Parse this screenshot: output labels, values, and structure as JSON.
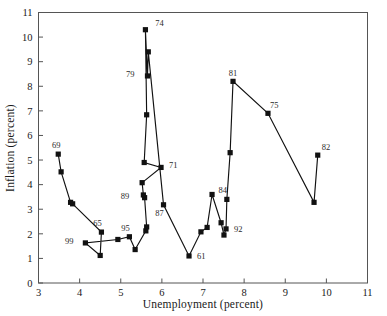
{
  "chart_data": {
    "type": "line",
    "title": "",
    "subtitle": "",
    "xlabel": "Unemployment (percent)",
    "ylabel": "Inflation (percent)",
    "xlim": [
      3,
      11
    ],
    "ylim": [
      0,
      11
    ],
    "xticks": [
      3,
      4,
      5,
      6,
      7,
      8,
      9,
      10,
      11
    ],
    "yticks": [
      0,
      1,
      2,
      3,
      4,
      5,
      6,
      7,
      8,
      9,
      10,
      11
    ],
    "xtick_labels": [
      "3",
      "4",
      "5",
      "6",
      "7",
      "8",
      "9",
      "10",
      "11"
    ],
    "ytick_labels": [
      "0",
      "1",
      "2",
      "3",
      "4",
      "5",
      "6",
      "7",
      "8",
      "9",
      "10",
      "11"
    ],
    "grid": false,
    "legend": false,
    "legend_position": "none",
    "marker": "square",
    "series": [
      {
        "name": "US Phillips curve path",
        "x": [
          3.48,
          3.55,
          3.78,
          3.83,
          4.53,
          4.5,
          4.14,
          4.93,
          5.21,
          5.35,
          5.61,
          5.63,
          5.58,
          5.55,
          5.52,
          5.98,
          5.57,
          5.63,
          5.6,
          5.65,
          5.67,
          6.04,
          6.66,
          6.95,
          7.1,
          7.22,
          7.44,
          7.51,
          7.56,
          7.58,
          7.66,
          7.73,
          8.58,
          9.7,
          9.79
        ],
        "y": [
          5.24,
          4.52,
          3.28,
          3.22,
          2.07,
          1.12,
          1.63,
          1.77,
          1.88,
          1.36,
          2.12,
          2.28,
          3.47,
          3.58,
          4.08,
          4.7,
          4.9,
          6.84,
          10.3,
          8.42,
          9.4,
          3.18,
          1.1,
          2.08,
          2.26,
          3.6,
          2.45,
          1.95,
          2.2,
          3.4,
          5.3,
          8.2,
          6.9,
          3.28,
          5.2
        ]
      }
    ],
    "point_labels": [
      {
        "text": "69",
        "x": 3.48,
        "y": 5.24
      },
      {
        "text": "99",
        "x": 4.14,
        "y": 1.63
      },
      {
        "text": "65",
        "x": 4.53,
        "y": 2.07
      },
      {
        "text": "95",
        "x": 5.21,
        "y": 1.88
      },
      {
        "text": "89",
        "x": 5.52,
        "y": 3.5
      },
      {
        "text": "87",
        "x": 6.04,
        "y": 3.18
      },
      {
        "text": "61",
        "x": 6.66,
        "y": 1.1
      },
      {
        "text": "71",
        "x": 5.98,
        "y": 4.7
      },
      {
        "text": "92",
        "x": 7.56,
        "y": 2.2
      },
      {
        "text": "84",
        "x": 7.58,
        "y": 3.4
      },
      {
        "text": "79",
        "x": 5.65,
        "y": 8.42
      },
      {
        "text": "74",
        "x": 5.67,
        "y": 10.3
      },
      {
        "text": "81",
        "x": 7.73,
        "y": 8.2
      },
      {
        "text": "75",
        "x": 8.58,
        "y": 6.9
      },
      {
        "text": "82",
        "x": 9.79,
        "y": 5.2
      }
    ]
  },
  "axes": {
    "x_title": "Unemployment (percent)",
    "y_title": "Inflation (percent)"
  }
}
